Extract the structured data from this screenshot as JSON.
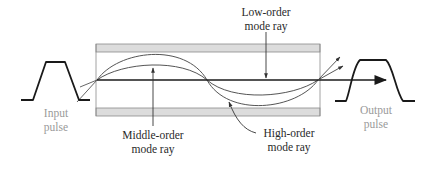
{
  "figure": {
    "colors": {
      "cladding_fill": "#dcdcdc",
      "cladding_stroke": "#8a8a8a",
      "ray_stroke": "#555555",
      "axis_stroke": "#1a1a1a",
      "pulse_stroke": "#1a1a1a",
      "label_dark": "#2a2a2a",
      "label_gray": "#9a9a9a"
    }
  },
  "labels": {
    "low_order": {
      "line1": "Low-order",
      "line2": "mode ray"
    },
    "middle_order": {
      "line1": "Middle-order",
      "line2": "mode ray"
    },
    "high_order": {
      "line1": "High-order",
      "line2": "mode ray"
    },
    "input": {
      "line1": "Input",
      "line2": "pulse"
    },
    "output": {
      "line1": "Output",
      "line2": "pulse"
    }
  },
  "elements": {
    "fiber": {
      "x": 96,
      "width": 224,
      "top_cladding_y": [
        44,
        52
      ],
      "bottom_cladding_y": [
        108,
        116
      ],
      "core_axis_y": 80
    },
    "rays": [
      {
        "name": "low-order",
        "description": "straight along axis"
      },
      {
        "name": "middle-order",
        "description": "shallow sinusoid"
      },
      {
        "name": "high-order",
        "description": "steep sinusoid reaching cladding"
      }
    ],
    "pulses": [
      {
        "name": "input",
        "shape": "narrow trapezoid"
      },
      {
        "name": "output",
        "shape": "broadened trapezoid"
      }
    ]
  }
}
